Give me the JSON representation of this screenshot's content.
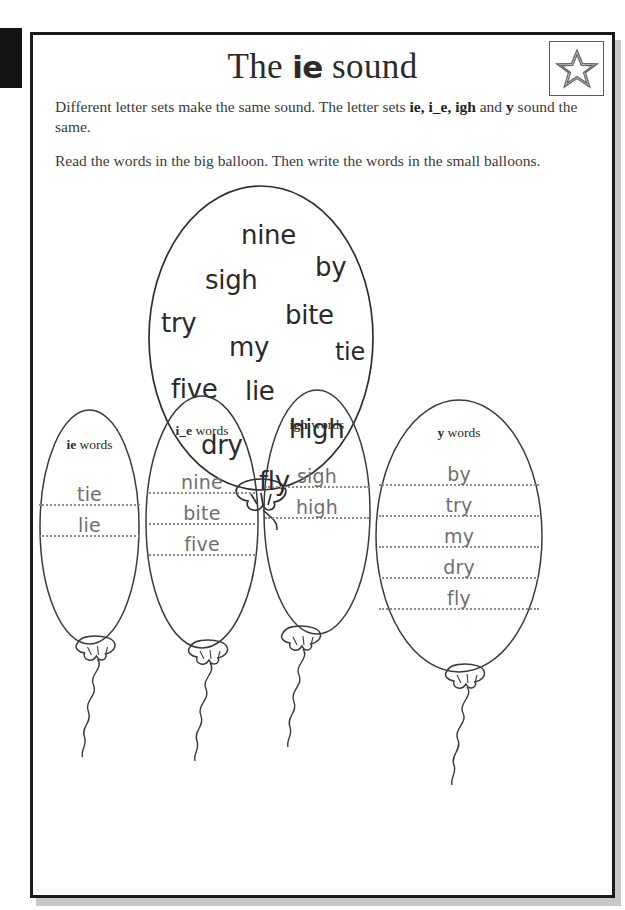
{
  "worksheet": {
    "title_prefix": "The ",
    "title_sound": "ie",
    "title_suffix": " sound",
    "star_icon": "star-icon",
    "instruction_1_a": "Different letter sets make the same sound. The letter sets ",
    "instruction_1_b": "ie, i_e, igh",
    "instruction_1_c": " and ",
    "instruction_1_d": "y",
    "instruction_1_e": " sound the same.",
    "instruction_2": "Read the words in the big balloon. Then write the words in the small balloons."
  },
  "big_balloon": {
    "name": "word-bank-balloon",
    "words": [
      {
        "text": "nine",
        "x": 108,
        "y": 40,
        "size": 26
      },
      {
        "text": "sigh",
        "x": 72,
        "y": 85,
        "size": 26
      },
      {
        "text": "by",
        "x": 182,
        "y": 72,
        "size": 26
      },
      {
        "text": "try",
        "x": 28,
        "y": 128,
        "size": 26
      },
      {
        "text": "bite",
        "x": 152,
        "y": 120,
        "size": 26
      },
      {
        "text": "my",
        "x": 96,
        "y": 152,
        "size": 26
      },
      {
        "text": "tie",
        "x": 202,
        "y": 158,
        "size": 24
      },
      {
        "text": "five",
        "x": 38,
        "y": 194,
        "size": 26
      },
      {
        "text": "lie",
        "x": 112,
        "y": 196,
        "size": 26
      },
      {
        "text": "high",
        "x": 156,
        "y": 234,
        "size": 26
      },
      {
        "text": "dry",
        "x": 68,
        "y": 250,
        "size": 26
      },
      {
        "text": "fly",
        "x": 126,
        "y": 286,
        "size": 26
      }
    ]
  },
  "answer_balloons": [
    {
      "id": "ie-words-balloon",
      "label_prefix": "ie",
      "label_suffix": " words",
      "answers": [
        "tie",
        "lie"
      ],
      "blank_count": 2
    },
    {
      "id": "i_e-words-balloon",
      "label_prefix": "i_e",
      "label_suffix": " words",
      "answers": [
        "nine",
        "bite",
        "five"
      ],
      "blank_count": 3
    },
    {
      "id": "igh-words-balloon",
      "label_prefix": "igh",
      "label_suffix": " words",
      "answers": [
        "sigh",
        "high"
      ],
      "blank_count": 2
    },
    {
      "id": "y-words-balloon",
      "label_prefix": "y",
      "label_suffix": " words",
      "answers": [
        "by",
        "try",
        "my",
        "dry",
        "fly"
      ],
      "blank_count": 5
    }
  ],
  "colors": {
    "ink": "#2a2a2a",
    "handwriting": "#6f6f6f",
    "line": "#8c8c8c",
    "border": "#1a1a1a",
    "shadow": "#c8c8c8"
  }
}
